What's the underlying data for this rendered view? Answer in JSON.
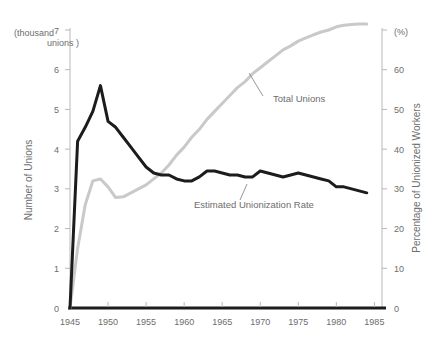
{
  "chart_data": {
    "type": "line",
    "title": "",
    "xlabel": "",
    "ylabel": "Number of Unions",
    "y2label": "Percentage of Unionized Workers",
    "y_unit": "(thousand\nunions )",
    "y_unit_line1": "(thousand",
    "y_unit_line2": "unions )",
    "y2_unit": "(%)",
    "xlim": [
      1945,
      1986
    ],
    "ylim": [
      0,
      7
    ],
    "y2lim": [
      0,
      70
    ],
    "xticks": [
      1945,
      1950,
      1955,
      1960,
      1965,
      1970,
      1975,
      1980,
      1985
    ],
    "xticklabels": [
      "1945",
      "1950",
      "1955",
      "1960",
      "1965",
      "1970",
      "1975",
      "1980",
      "1985"
    ],
    "yticks": [
      0,
      1,
      2,
      3,
      4,
      5,
      6,
      7
    ],
    "yticklabels": [
      "0",
      "1",
      "2",
      "3",
      "4",
      "5",
      "6",
      "7"
    ],
    "y2ticks": [
      0,
      10,
      20,
      30,
      40,
      50,
      60,
      70
    ],
    "y2ticklabels": [
      "0",
      "10",
      "20",
      "30",
      "40",
      "50",
      "60",
      ""
    ],
    "grid": false,
    "legend_position": "inline-annotations",
    "series": [
      {
        "name": "Total Unions",
        "axis": "left",
        "color": "#c9c9c9",
        "linewidth": 3,
        "x": [
          1945,
          1946,
          1947,
          1948,
          1949,
          1950,
          1951,
          1952,
          1953,
          1954,
          1955,
          1956,
          1957,
          1958,
          1959,
          1960,
          1961,
          1962,
          1963,
          1964,
          1965,
          1966,
          1967,
          1968,
          1969,
          1970,
          1971,
          1972,
          1973,
          1974,
          1975,
          1976,
          1977,
          1978,
          1979,
          1980,
          1981,
          1982,
          1983,
          1984
        ],
        "values": [
          0.0,
          1.5,
          2.6,
          3.2,
          3.25,
          3.05,
          2.78,
          2.8,
          2.9,
          3.0,
          3.1,
          3.25,
          3.4,
          3.6,
          3.85,
          4.05,
          4.3,
          4.5,
          4.75,
          4.95,
          5.15,
          5.35,
          5.55,
          5.7,
          5.9,
          6.05,
          6.2,
          6.35,
          6.5,
          6.6,
          6.72,
          6.8,
          6.88,
          6.95,
          7.0,
          7.08,
          7.12,
          7.14,
          7.15,
          7.15
        ]
      },
      {
        "name": "Estimated Unionization Rate",
        "axis": "right",
        "color": "#1c1c1c",
        "linewidth": 3,
        "x": [
          1945,
          1946,
          1947,
          1948,
          1949,
          1950,
          1951,
          1952,
          1953,
          1954,
          1955,
          1956,
          1957,
          1958,
          1959,
          1960,
          1961,
          1962,
          1963,
          1964,
          1965,
          1966,
          1967,
          1968,
          1969,
          1970,
          1971,
          1972,
          1973,
          1974,
          1975,
          1976,
          1977,
          1978,
          1979,
          1980,
          1981,
          1982,
          1983,
          1984
        ],
        "values": [
          0.0,
          42.0,
          45.5,
          49.5,
          56.0,
          47.0,
          45.5,
          43.0,
          40.5,
          38.0,
          35.5,
          34.0,
          33.5,
          33.5,
          32.5,
          32.0,
          32.0,
          33.0,
          34.5,
          34.5,
          34.0,
          33.5,
          33.5,
          33.0,
          33.0,
          34.5,
          34.0,
          33.5,
          33.0,
          33.5,
          34.0,
          33.5,
          33.0,
          32.5,
          32.0,
          30.5,
          30.5,
          30.0,
          29.5,
          29.0
        ]
      }
    ],
    "annotations": [
      {
        "text": "Total Unions",
        "x": 273,
        "y": 102,
        "leader_x1": 263,
        "leader_y1": 96,
        "leader_x2": 249,
        "leader_y2": 73
      },
      {
        "text": "Estimated Unionization Rate",
        "x": 194,
        "y": 208,
        "leader_x1": 240,
        "leader_y1": 200,
        "leader_x2": 247,
        "leader_y2": 184
      }
    ]
  }
}
